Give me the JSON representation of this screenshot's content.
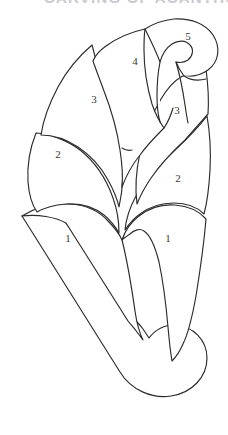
{
  "document": {
    "title": "Numbered Petal Layer Diagram",
    "clipped_header_text": "CARVING OF ACANTHUS"
  },
  "figure": {
    "name": "acanthus-leaf-bud-outline",
    "background_color": "#ffffff",
    "stroke_color": "#2b2b2b",
    "label_color": "#3a3a3a",
    "stroke_width": 1.15
  },
  "labels": [
    {
      "id": "label-tier-1-left",
      "text": "1",
      "x": 68,
      "y": 239
    },
    {
      "id": "label-tier-1-right",
      "text": "1",
      "x": 168,
      "y": 239
    },
    {
      "id": "label-tier-2-left",
      "text": "2",
      "x": 58,
      "y": 155
    },
    {
      "id": "label-tier-2-right",
      "text": "2",
      "x": 178,
      "y": 179
    },
    {
      "id": "label-tier-3-left",
      "text": "3",
      "x": 94,
      "y": 100
    },
    {
      "id": "label-tier-3-right",
      "text": "3",
      "x": 177,
      "y": 111
    },
    {
      "id": "label-tier-4",
      "text": "4",
      "x": 135,
      "y": 62
    },
    {
      "id": "label-tier-5",
      "text": "5",
      "x": 188,
      "y": 37
    }
  ],
  "regions": [
    {
      "id": "petal-tier-1-left",
      "label": "1",
      "name": "petal-tier-1-left"
    },
    {
      "id": "petal-tier-1-right",
      "label": "1",
      "name": "petal-tier-1-right"
    },
    {
      "id": "petal-tier-2-left",
      "label": "2",
      "name": "petal-tier-2-left"
    },
    {
      "id": "petal-tier-2-right",
      "label": "2",
      "name": "petal-tier-2-right"
    },
    {
      "id": "petal-tier-3-left",
      "label": "3",
      "name": "petal-tier-3-left"
    },
    {
      "id": "petal-tier-3-right",
      "label": "3",
      "name": "petal-tier-3-right"
    },
    {
      "id": "petal-tier-4",
      "label": "4",
      "name": "petal-tier-4"
    },
    {
      "id": "petal-tier-5",
      "label": "5",
      "name": "petal-tier-5"
    },
    {
      "id": "stem-volute-tail",
      "label": "",
      "name": "stem-volute-tail"
    }
  ]
}
